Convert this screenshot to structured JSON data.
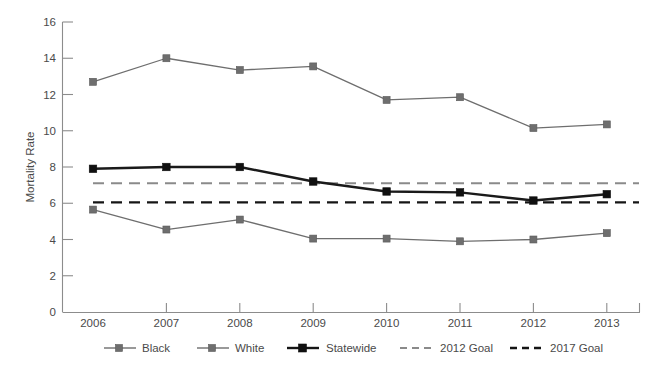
{
  "chart_data": {
    "type": "line",
    "title": "",
    "xlabel": "",
    "ylabel": "Mortality Rate",
    "categories": [
      "2006",
      "2007",
      "2008",
      "2009",
      "2010",
      "2011",
      "2012",
      "2013"
    ],
    "x": [
      2006,
      2007,
      2008,
      2009,
      2010,
      2011,
      2012,
      2013
    ],
    "ylim": [
      0,
      16
    ],
    "yticks": [
      0,
      2,
      4,
      6,
      8,
      10,
      12,
      14,
      16
    ],
    "ytick_labels": [
      "0",
      "2",
      "4",
      "6",
      "8",
      "10",
      "12",
      "14",
      "16"
    ],
    "grid": false,
    "legend_position": "bottom",
    "series": [
      {
        "name": "Black",
        "style": "solid",
        "color": "#6e6e6e",
        "marker": "square",
        "values": [
          12.7,
          14.0,
          13.35,
          13.55,
          11.7,
          11.85,
          10.15,
          10.35
        ]
      },
      {
        "name": "White",
        "style": "solid",
        "color": "#6e6e6e",
        "marker": "square",
        "values": [
          5.65,
          4.55,
          5.1,
          4.05,
          4.05,
          3.9,
          4.0,
          4.35
        ]
      },
      {
        "name": "Statewide",
        "style": "solid-bold",
        "color": "#101010",
        "marker": "square",
        "values": [
          7.9,
          8.0,
          8.0,
          7.2,
          6.65,
          6.6,
          6.15,
          6.5
        ]
      }
    ],
    "reference_lines": [
      {
        "name": "2012 Goal",
        "style": "dashed",
        "color": "#8a8a8a",
        "value": 7.1
      },
      {
        "name": "2017 Goal",
        "style": "dashed",
        "color": "#151515",
        "value": 6.05
      }
    ],
    "legend": [
      {
        "label": "Black",
        "kind": "line-marker",
        "color": "#6e6e6e"
      },
      {
        "label": "White",
        "kind": "line-marker",
        "color": "#6e6e6e"
      },
      {
        "label": "Statewide",
        "kind": "line-marker-bold",
        "color": "#151515"
      },
      {
        "label": "2012 Goal",
        "kind": "dashed",
        "color": "#8a8a8a"
      },
      {
        "label": "2017 Goal",
        "kind": "dashed",
        "color": "#151515"
      }
    ]
  },
  "axes": {
    "y_title": "Mortality Rate",
    "y_labels": [
      "16",
      "14",
      "12",
      "10",
      "8",
      "6",
      "4",
      "2",
      "0"
    ],
    "x_labels": [
      "2006",
      "2007",
      "2008",
      "2009",
      "2010",
      "2011",
      "2012",
      "2013"
    ]
  },
  "legend": {
    "items": [
      {
        "label": "Black"
      },
      {
        "label": "White"
      },
      {
        "label": "Statewide"
      },
      {
        "label": "2012 Goal"
      },
      {
        "label": "2017 Goal"
      }
    ]
  }
}
